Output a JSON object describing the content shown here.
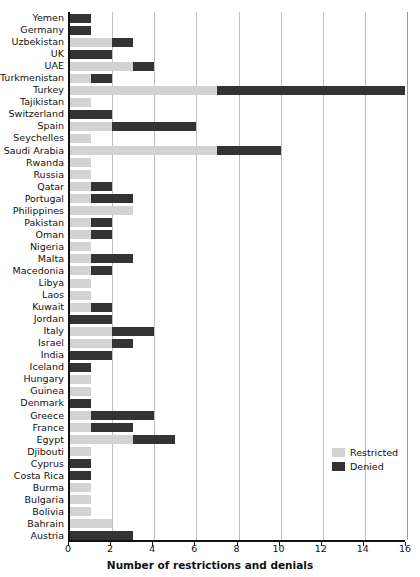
{
  "chart_data": {
    "type": "bar",
    "orientation": "horizontal",
    "stacked": true,
    "title": "",
    "xlabel": "Number of restrictions and denials",
    "ylabel": "",
    "xlim": [
      0,
      16
    ],
    "xticks": [
      0,
      2,
      4,
      6,
      8,
      10,
      12,
      14,
      16
    ],
    "grid": "vertical",
    "legend_position": "bottom-right",
    "colors": {
      "restricted": "#d3d3d3",
      "denied": "#333333",
      "gridline": "#bfbfbf",
      "axis": "#111111",
      "background": "#ffffff"
    },
    "legend": [
      {
        "name": "Restricted",
        "color": "#d3d3d3"
      },
      {
        "name": "Denied",
        "color": "#333333"
      }
    ],
    "categories": [
      "Yemen",
      "Germany",
      "Uzbekistan",
      "UK",
      "UAE",
      "Turkmenistan",
      "Turkey",
      "Tajikistan",
      "Switzerland",
      "Spain",
      "Seychelles",
      "Saudi Arabia",
      "Rwanda",
      "Russia",
      "Qatar",
      "Portugal",
      "Philippines",
      "Pakistan",
      "Oman",
      "Nigeria",
      "Malta",
      "Macedonia",
      "Libya",
      "Laos",
      "Kuwait",
      "Jordan",
      "Italy",
      "Israel",
      "India",
      "Iceland",
      "Hungary",
      "Guinea",
      "Denmark",
      "Greece",
      "France",
      "Egypt",
      "Djibouti",
      "Cyprus",
      "Costa Rica",
      "Burma",
      "Bulgaria",
      "Bolivia",
      "Bahrain",
      "Austria"
    ],
    "series": [
      {
        "name": "Restricted",
        "values": [
          0,
          0,
          2,
          0,
          3,
          1,
          7,
          1,
          0,
          2,
          1,
          7,
          1,
          1,
          1,
          1,
          3,
          1,
          1,
          1,
          1,
          1,
          1,
          1,
          1,
          0,
          2,
          2,
          0,
          0,
          1,
          1,
          0,
          1,
          1,
          3,
          1,
          0,
          0,
          1,
          1,
          1,
          2,
          0
        ]
      },
      {
        "name": "Denied",
        "values": [
          1,
          1,
          1,
          2,
          1,
          1,
          9,
          0,
          2,
          4,
          0,
          3,
          0,
          0,
          1,
          2,
          0,
          1,
          1,
          0,
          2,
          1,
          0,
          0,
          1,
          2,
          2,
          1,
          2,
          1,
          0,
          0,
          1,
          3,
          2,
          2,
          0,
          1,
          1,
          0,
          0,
          0,
          0,
          3
        ]
      }
    ],
    "totals": [
      1,
      1,
      3,
      2,
      4,
      2,
      16,
      1,
      2,
      6,
      1,
      10,
      1,
      1,
      2,
      3,
      3,
      2,
      2,
      1,
      3,
      2,
      1,
      1,
      2,
      2,
      4,
      3,
      2,
      1,
      1,
      1,
      1,
      4,
      3,
      5,
      1,
      1,
      1,
      1,
      1,
      1,
      2,
      3
    ]
  }
}
